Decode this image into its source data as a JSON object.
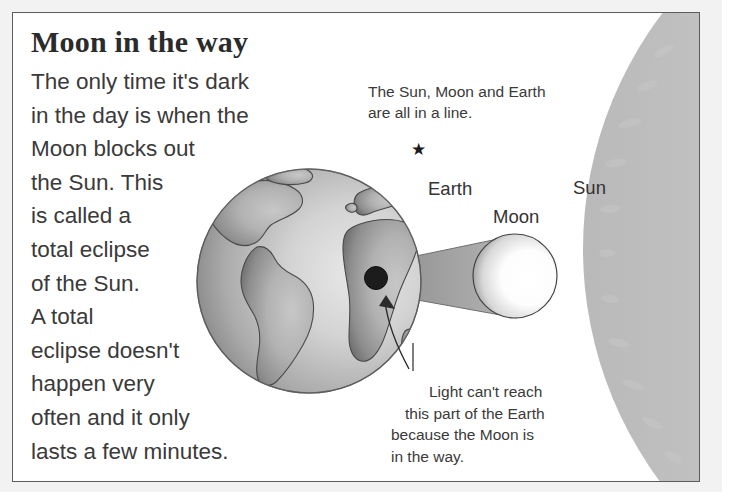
{
  "page": {
    "title": "Moon in the way",
    "body_lines": [
      "The only time it's dark",
      "in the day is when the",
      "Moon blocks out",
      "the Sun. This",
      "is called a",
      "total eclipse",
      "of the Sun.",
      "A total",
      "eclipse doesn't",
      "happen very",
      "often and it only",
      "lasts a few minutes."
    ]
  },
  "diagram": {
    "caption_top_lines": [
      "The Sun, Moon and Earth",
      "are all in a line."
    ],
    "caption_bottom_lines": [
      "Light can't reach",
      "this part of the Earth",
      "because the Moon is",
      "in the way."
    ],
    "labels": {
      "earth": "Earth",
      "moon": "Moon",
      "sun": "Sun"
    },
    "star_glyph": "★",
    "bodies": {
      "earth": {
        "name": "Earth",
        "cx": 296,
        "cy": 268,
        "r": 112
      },
      "moon": {
        "name": "Moon",
        "cx": 502,
        "cy": 263,
        "r": 42
      },
      "sun": {
        "name": "Sun",
        "shape": "large-arc-right-edge"
      },
      "umbra_spot": {
        "name": "eclipse-shadow-spot",
        "cx": 363,
        "cy": 265,
        "r": 11
      }
    }
  },
  "colors": {
    "panel_border": "#5c5c5c",
    "page_margin": "#f2f2f2",
    "text": "#3a3a3a",
    "title_text": "#2b2b2b",
    "shadow_cone": "#9a9a9a",
    "umbra": "#1c1c1c",
    "land": "#9e9e9e",
    "ocean": "#c9c9c9"
  }
}
